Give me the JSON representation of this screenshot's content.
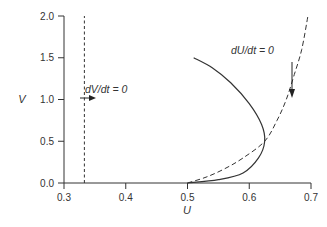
{
  "chart_data": {
    "type": "line",
    "title": "",
    "xlabel": "U",
    "ylabel": "V",
    "xlim": [
      0.3,
      0.7
    ],
    "ylim": [
      0.0,
      2.0
    ],
    "xticks": [
      "0.3",
      "0.4",
      "0.5",
      "0.6",
      "0.7"
    ],
    "yticks": [
      "0.0",
      "0.5",
      "1.0",
      "1.5",
      "2.0"
    ],
    "grid": false,
    "legend": null,
    "series": [
      {
        "name": "dV/dt = 0",
        "style": "dashed",
        "points": [
          [
            0.333,
            0.0
          ],
          [
            0.333,
            2.0
          ]
        ]
      },
      {
        "name": "dU/dt = 0",
        "style": "dashed",
        "points": [
          [
            0.5,
            0.0
          ],
          [
            0.53,
            0.07
          ],
          [
            0.56,
            0.17
          ],
          [
            0.59,
            0.3
          ],
          [
            0.625,
            0.5
          ],
          [
            0.645,
            0.75
          ],
          [
            0.66,
            1.0
          ],
          [
            0.673,
            1.3
          ],
          [
            0.685,
            1.6
          ],
          [
            0.695,
            2.0
          ]
        ]
      },
      {
        "name": "trajectory",
        "style": "solid",
        "points": [
          [
            0.5,
            0.0
          ],
          [
            0.55,
            0.04
          ],
          [
            0.59,
            0.12
          ],
          [
            0.615,
            0.3
          ],
          [
            0.625,
            0.5
          ],
          [
            0.62,
            0.7
          ],
          [
            0.6,
            0.95
          ],
          [
            0.57,
            1.2
          ],
          [
            0.54,
            1.38
          ],
          [
            0.51,
            1.5
          ]
        ]
      }
    ],
    "annotations": [
      {
        "text": "dV/dt = 0",
        "x": 0.34,
        "y": 1.15,
        "arrow": "right",
        "arrow_at": [
          0.333,
          1.03
        ]
      },
      {
        "text": "dU/dt = 0",
        "x": 0.6,
        "y": 1.8,
        "arrow": "down",
        "arrow_at": [
          0.67,
          1.0
        ]
      }
    ]
  }
}
